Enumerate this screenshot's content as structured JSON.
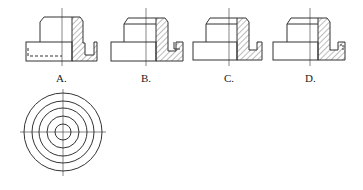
{
  "figure": {
    "options": [
      {
        "label": "A.",
        "x": 53,
        "view": "A"
      },
      {
        "label": "B.",
        "x": 138,
        "view": "B"
      },
      {
        "label": "C.",
        "x": 221,
        "view": "C"
      },
      {
        "label": "D.",
        "x": 304,
        "view": "D"
      }
    ],
    "top_view": {
      "description": "concentric circles with center lines",
      "center": [
        63,
        132
      ],
      "radii": [
        39,
        31,
        24,
        16,
        8
      ]
    },
    "colors": {
      "line": "#333333",
      "hatch": "#555555"
    }
  }
}
